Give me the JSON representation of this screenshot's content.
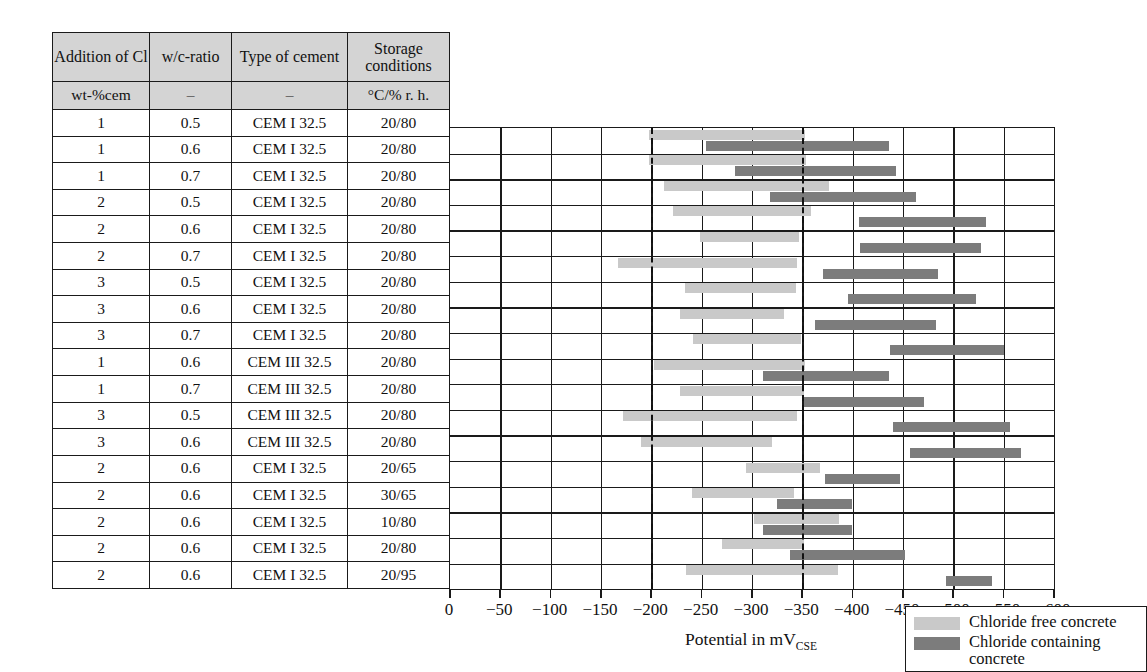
{
  "table": {
    "headers": [
      "Addition of Cl",
      "w/c-ratio",
      "Type of cement",
      "Storage conditions"
    ],
    "units": [
      "wt-%cem",
      "–",
      "–",
      "°C/% r. h."
    ],
    "rows": [
      [
        "1",
        "0.5",
        "CEM I 32.5",
        "20/80"
      ],
      [
        "1",
        "0.6",
        "CEM I 32.5",
        "20/80"
      ],
      [
        "1",
        "0.7",
        "CEM I 32.5",
        "20/80"
      ],
      [
        "2",
        "0.5",
        "CEM I 32.5",
        "20/80"
      ],
      [
        "2",
        "0.6",
        "CEM I 32.5",
        "20/80"
      ],
      [
        "2",
        "0.7",
        "CEM I 32.5",
        "20/80"
      ],
      [
        "3",
        "0.5",
        "CEM I 32.5",
        "20/80"
      ],
      [
        "3",
        "0.6",
        "CEM I 32.5",
        "20/80"
      ],
      [
        "3",
        "0.7",
        "CEM I 32.5",
        "20/80"
      ],
      [
        "1",
        "0.6",
        "CEM III 32.5",
        "20/80"
      ],
      [
        "1",
        "0.7",
        "CEM III 32.5",
        "20/80"
      ],
      [
        "3",
        "0.5",
        "CEM III 32.5",
        "20/80"
      ],
      [
        "3",
        "0.6",
        "CEM III 32.5",
        "20/80"
      ],
      [
        "2",
        "0.6",
        "CEM I 32.5",
        "20/65"
      ],
      [
        "2",
        "0.6",
        "CEM I 32.5",
        "30/65"
      ],
      [
        "2",
        "0.6",
        "CEM I 32.5",
        "10/80"
      ],
      [
        "2",
        "0.6",
        "CEM I 32.5",
        "20/80"
      ],
      [
        "2",
        "0.6",
        "CEM I 32.5",
        "20/95"
      ]
    ]
  },
  "legend": {
    "items": [
      {
        "label": "Chloride free concrete",
        "color": "#c9c9c9",
        "key": "chloride-free"
      },
      {
        "label": "Chloride containing concrete",
        "color": "#7c7c7c",
        "key": "chloride-containing"
      }
    ]
  },
  "chart_data": {
    "type": "bar",
    "orientation": "horizontal-range",
    "title": "",
    "xlabel": "Potential in mV",
    "xlabel_sub": "CSE",
    "ylabel": "",
    "xlim": [
      0,
      -600
    ],
    "xticks": [
      0,
      -50,
      -100,
      -150,
      -200,
      -250,
      -300,
      -350,
      -400,
      -450,
      -500,
      -550,
      -600
    ],
    "xticklabels": [
      "0",
      "−50",
      "−100",
      "−150",
      "−200",
      "−250",
      "−300",
      "−350",
      "−400",
      "−450",
      "−500",
      "−550",
      "−600"
    ],
    "grid": true,
    "gridlines_x": [
      -50,
      -100,
      -150,
      -200,
      -250,
      -300,
      -350,
      -400,
      -450,
      -500,
      -550
    ],
    "reference_lines": [
      -200,
      -350
    ],
    "legend_position": "inside-lower-left",
    "series": [
      {
        "name": "Chloride free concrete",
        "color": "#c9c9c9",
        "ranges": [
          [
            -198,
            -353
          ],
          [
            -198,
            -354
          ],
          [
            -213,
            -377
          ],
          [
            -222,
            -359
          ],
          [
            -248,
            -347
          ],
          [
            -167,
            -345
          ],
          [
            -233,
            -344
          ],
          [
            -228,
            -332
          ],
          [
            -241,
            -349
          ],
          [
            -203,
            -353
          ],
          [
            -228,
            -352
          ],
          [
            -172,
            -345
          ],
          [
            -190,
            -320
          ],
          [
            -294,
            -368
          ],
          [
            -240,
            -342
          ],
          [
            -302,
            -386
          ],
          [
            -270,
            -352
          ],
          [
            -234,
            -385
          ]
        ]
      },
      {
        "name": "Chloride containing concrete",
        "color": "#7c7c7c",
        "ranges": [
          [
            -254,
            -436
          ],
          [
            -283,
            -443
          ],
          [
            -318,
            -463
          ],
          [
            -406,
            -532
          ],
          [
            -407,
            -527
          ],
          [
            -371,
            -485
          ],
          [
            -395,
            -523
          ],
          [
            -363,
            -483
          ],
          [
            -437,
            -550
          ],
          [
            -311,
            -436
          ],
          [
            -352,
            -471
          ],
          [
            -440,
            -556
          ],
          [
            -457,
            -567
          ],
          [
            -373,
            -447
          ],
          [
            -325,
            -399
          ],
          [
            -311,
            -399
          ],
          [
            -338,
            -452
          ],
          [
            -493,
            -538
          ]
        ]
      }
    ]
  }
}
